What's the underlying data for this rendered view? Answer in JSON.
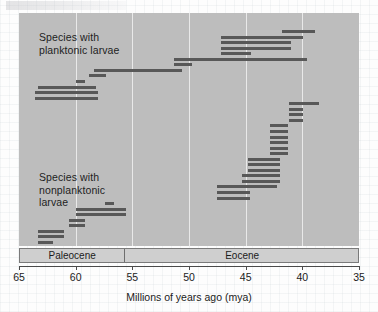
{
  "chart_data": {
    "type": "bar",
    "title": "",
    "subtitle": "",
    "xlabel": "Millions of years ago (mya)",
    "ylabel": "",
    "orientation": "horizontal-ranges",
    "xlim": [
      65,
      35
    ],
    "x_reversed": true,
    "grid": "vertical gridlines at 60, 55, 50, 45, 40",
    "tick_labels": [
      "65",
      "60",
      "55",
      "50",
      "45",
      "40",
      "35"
    ],
    "tick_values": [
      65,
      60,
      55,
      50,
      45,
      40,
      35
    ],
    "gridlines": [
      60,
      55,
      50,
      45,
      40
    ],
    "legend": [],
    "annotations": [
      {
        "text": "Species with\nplanktonic larvae",
        "x_mya": 63.0,
        "y_index": 1
      },
      {
        "text": "Species with\nnonplanktonic\nlarvae",
        "x_mya": 63.0,
        "y_index": 27
      }
    ],
    "epoch_bands": [
      {
        "label": "Paleocene",
        "start_mya": 65.0,
        "end_mya": 55.8
      },
      {
        "label": "Eocene",
        "start_mya": 55.8,
        "end_mya": 35.0
      }
    ],
    "colors": {
      "plot_background": "#bdbdbd",
      "bar": "#585858",
      "gridline": "#e9e9e9",
      "epoch_band": "#cfcfcf",
      "axis": "#4a4a4a",
      "text": "#1b1b1b"
    },
    "series": [
      {
        "name": "Species with planktonic larvae",
        "units": "mya (stratigraphic range)",
        "ranges": [
          {
            "start_mya": 38.9,
            "end_mya": 41.8,
            "row": 0
          },
          {
            "start_mya": 39.9,
            "end_mya": 47.2,
            "row": 1
          },
          {
            "start_mya": 41.0,
            "end_mya": 47.2,
            "row": 2
          },
          {
            "start_mya": 41.0,
            "end_mya": 47.2,
            "row": 3
          },
          {
            "start_mya": 44.5,
            "end_mya": 47.2,
            "row": 4
          },
          {
            "start_mya": 39.6,
            "end_mya": 51.3,
            "row": 5
          },
          {
            "start_mya": 49.7,
            "end_mya": 51.3,
            "row": 6
          },
          {
            "start_mya": 50.6,
            "end_mya": 58.4,
            "row": 7
          },
          {
            "start_mya": 57.3,
            "end_mya": 58.8,
            "row": 8
          },
          {
            "start_mya": 59.2,
            "end_mya": 60.0,
            "row": 9
          },
          {
            "start_mya": 58.2,
            "end_mya": 63.3,
            "row": 10
          },
          {
            "start_mya": 58.0,
            "end_mya": 63.6,
            "row": 11
          },
          {
            "start_mya": 58.0,
            "end_mya": 63.6,
            "row": 12
          }
        ]
      },
      {
        "name": "Species with nonplanktonic larvae",
        "units": "mya (stratigraphic range)",
        "ranges": [
          {
            "start_mya": 38.5,
            "end_mya": 41.2,
            "row": 13
          },
          {
            "start_mya": 39.9,
            "end_mya": 41.2,
            "row": 14
          },
          {
            "start_mya": 39.9,
            "end_mya": 41.2,
            "row": 15
          },
          {
            "start_mya": 39.9,
            "end_mya": 41.2,
            "row": 16
          },
          {
            "start_mya": 41.3,
            "end_mya": 42.9,
            "row": 17
          },
          {
            "start_mya": 41.3,
            "end_mya": 42.9,
            "row": 18
          },
          {
            "start_mya": 41.3,
            "end_mya": 42.9,
            "row": 19
          },
          {
            "start_mya": 41.3,
            "end_mya": 42.9,
            "row": 20
          },
          {
            "start_mya": 41.3,
            "end_mya": 42.9,
            "row": 21
          },
          {
            "start_mya": 41.3,
            "end_mya": 42.9,
            "row": 22
          },
          {
            "start_mya": 42.0,
            "end_mya": 44.8,
            "row": 23
          },
          {
            "start_mya": 42.0,
            "end_mya": 44.8,
            "row": 24
          },
          {
            "start_mya": 42.0,
            "end_mya": 44.8,
            "row": 25
          },
          {
            "start_mya": 42.0,
            "end_mya": 45.3,
            "row": 26
          },
          {
            "start_mya": 42.0,
            "end_mya": 45.3,
            "row": 27
          },
          {
            "start_mya": 42.2,
            "end_mya": 47.5,
            "row": 28
          },
          {
            "start_mya": 44.6,
            "end_mya": 47.5,
            "row": 29
          },
          {
            "start_mya": 44.6,
            "end_mya": 47.5,
            "row": 30
          },
          {
            "start_mya": 56.6,
            "end_mya": 57.4,
            "row": 31
          },
          {
            "start_mya": 55.6,
            "end_mya": 60.0,
            "row": 32
          },
          {
            "start_mya": 55.6,
            "end_mya": 60.0,
            "row": 33
          },
          {
            "start_mya": 59.2,
            "end_mya": 60.6,
            "row": 34
          },
          {
            "start_mya": 59.2,
            "end_mya": 60.6,
            "row": 35
          },
          {
            "start_mya": 61.0,
            "end_mya": 63.3,
            "row": 36
          },
          {
            "start_mya": 61.0,
            "end_mya": 63.3,
            "row": 37
          },
          {
            "start_mya": 62.0,
            "end_mya": 63.3,
            "row": 38
          }
        ]
      }
    ]
  },
  "chart": {
    "xlabel": "Millions of years ago (mya)",
    "annotation_planktonic": "Species with\nplanktonic larvae",
    "annotation_nonplanktonic": "Species with\nnonplanktonic\nlarvae",
    "epoch_paleocene": "Paleocene",
    "epoch_eocene": "Eocene",
    "tick_65": "65",
    "tick_60": "60",
    "tick_55": "55",
    "tick_50": "50",
    "tick_45": "45",
    "tick_40": "40",
    "tick_35": "35"
  }
}
